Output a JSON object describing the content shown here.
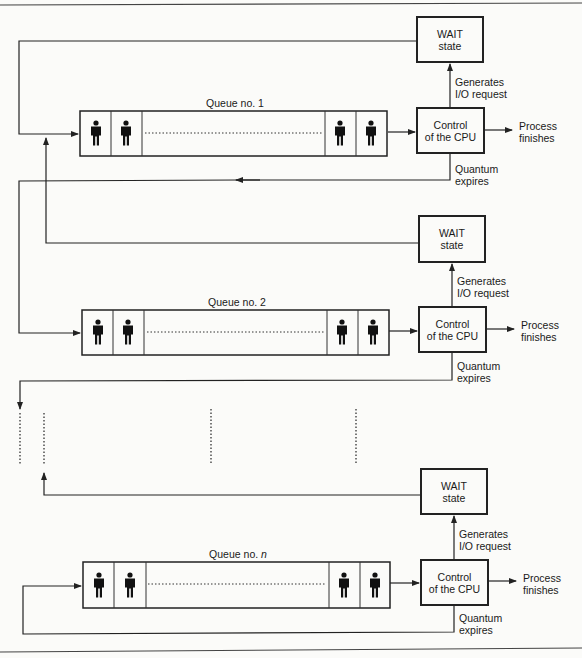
{
  "diagram": {
    "type": "multilevel-feedback-queue",
    "queues": [
      {
        "id": "q1",
        "label": "Queue no. 1",
        "label_italic_part": "",
        "wait_box": {
          "line1": "WAIT",
          "line2": "state"
        },
        "cpu_box": {
          "line1": "Control",
          "line2": "of the CPU"
        },
        "io_label": {
          "line1": "Generates",
          "line2": "I/O request"
        },
        "finish_label": {
          "line1": "Process",
          "line2": "finishes"
        },
        "quantum_label": {
          "line1": "Quantum",
          "line2": "expires"
        }
      },
      {
        "id": "q2",
        "label": "Queue no. 2",
        "label_italic_part": "",
        "wait_box": {
          "line1": "WAIT",
          "line2": "state"
        },
        "cpu_box": {
          "line1": "Control",
          "line2": "of the CPU"
        },
        "io_label": {
          "line1": "Generates",
          "line2": "I/O request"
        },
        "finish_label": {
          "line1": "Process",
          "line2": "finishes"
        },
        "quantum_label": {
          "line1": "Quantum",
          "line2": "expires"
        }
      },
      {
        "id": "qn",
        "label": "Queue no. ",
        "label_italic_part": "n",
        "wait_box": {
          "line1": "WAIT",
          "line2": "state"
        },
        "cpu_box": {
          "line1": "Control",
          "line2": "of the CPU"
        },
        "io_label": {
          "line1": "Generates",
          "line2": "I/O request"
        },
        "finish_label": {
          "line1": "Process",
          "line2": "finishes"
        },
        "quantum_label": {
          "line1": "Quantum",
          "line2": "expires"
        }
      }
    ],
    "icons": {
      "process": "person-icon"
    },
    "colors": {
      "line": "#222222",
      "background": "#fbfbf9"
    }
  }
}
